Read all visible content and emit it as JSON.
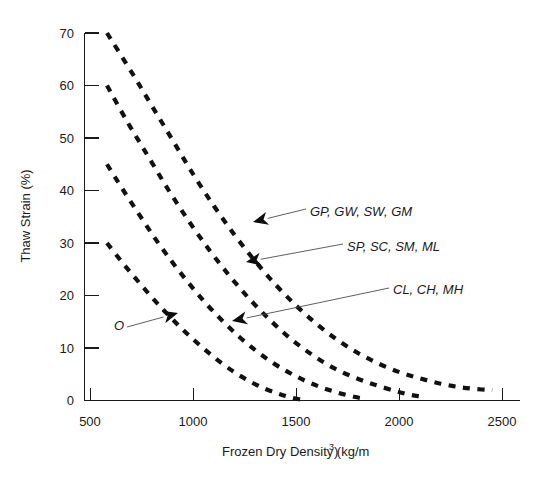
{
  "chart_data": {
    "type": "line",
    "title": "",
    "subtitle": "",
    "xlabel": "Frozen Dry Density (kg/m",
    "xlabel_sup": "3",
    "xlabel_tail": ")",
    "xlabel_full": "Frozen Dry Density (kg/m3)",
    "ylabel": "Thaw Strain (%)",
    "xlim": [
      450,
      2600
    ],
    "ylim": [
      0,
      70
    ],
    "xticks": [
      500,
      1000,
      1500,
      2000,
      2500
    ],
    "xtick_labels": [
      "500",
      "1000",
      "1500",
      "2000",
      "2500"
    ],
    "yticks": [
      0,
      10,
      20,
      30,
      40,
      50,
      60,
      70
    ],
    "ytick_labels": [
      "0",
      "10",
      "20",
      "30",
      "40",
      "50",
      "60",
      "70"
    ],
    "grid": false,
    "legend_position": "inline-annotations",
    "line_style": "dashed",
    "line_color": "#111111",
    "series": [
      {
        "name": "GP, GW, SW, GM",
        "label": "GP, GW, SW, GM",
        "x": [
          580,
          700,
          800,
          900,
          1000,
          1100,
          1200,
          1300,
          1400,
          1500,
          1600,
          1700,
          1800,
          1900,
          2000,
          2100,
          2200,
          2300,
          2400,
          2450
        ],
        "y": [
          70.0,
          62.5,
          56.0,
          49.5,
          43.0,
          37.0,
          31.5,
          26.5,
          22.0,
          18.0,
          14.5,
          11.5,
          9.0,
          7.0,
          5.4,
          4.2,
          3.2,
          2.5,
          2.1,
          2.0
        ]
      },
      {
        "name": "SP, SC, SM, ML",
        "label": "SP, SC, SM, ML",
        "x": [
          580,
          680,
          780,
          880,
          980,
          1080,
          1180,
          1280,
          1380,
          1480,
          1580,
          1680,
          1780,
          1880,
          1980,
          2050,
          2100
        ],
        "y": [
          60.0,
          53.0,
          46.5,
          40.0,
          34.0,
          28.5,
          23.5,
          19.0,
          15.0,
          11.5,
          8.6,
          6.2,
          4.4,
          3.0,
          1.8,
          1.1,
          0.8
        ]
      },
      {
        "name": "CL, CH, MH",
        "label": "CL, CH, MH",
        "x": [
          580,
          660,
          740,
          820,
          900,
          980,
          1060,
          1140,
          1220,
          1300,
          1380,
          1460,
          1540,
          1620,
          1700,
          1780,
          1820
        ],
        "y": [
          45.0,
          40.0,
          35.2,
          30.5,
          26.2,
          22.2,
          18.5,
          15.2,
          12.2,
          9.6,
          7.3,
          5.4,
          3.8,
          2.5,
          1.5,
          0.7,
          0.4
        ]
      },
      {
        "name": "O",
        "label": "O",
        "x": [
          580,
          650,
          720,
          790,
          860,
          930,
          1000,
          1070,
          1140,
          1210,
          1280,
          1350,
          1420,
          1480,
          1520
        ],
        "y": [
          30.0,
          26.5,
          23.2,
          20.0,
          17.0,
          14.2,
          11.6,
          9.2,
          7.0,
          5.1,
          3.5,
          2.2,
          1.2,
          0.5,
          0.2
        ]
      }
    ],
    "annotations": [
      {
        "text": "GP, GW, SW, GM",
        "text_x": 310,
        "text_y": 216,
        "leader_from_x": 306,
        "leader_from_y": 209,
        "arrow_to_x": 253,
        "arrow_to_y": 222
      },
      {
        "text": "SP, SC, SM, ML",
        "text_x": 347,
        "text_y": 251,
        "leader_from_x": 343,
        "leader_from_y": 244,
        "arrow_to_x": 246,
        "arrow_to_y": 262
      },
      {
        "text": "CL, CH, MH",
        "text_x": 393,
        "text_y": 294,
        "leader_from_x": 389,
        "leader_from_y": 288,
        "arrow_to_x": 232,
        "arrow_to_y": 321
      },
      {
        "text": "O",
        "text_x": 114,
        "text_y": 330,
        "leader_from_x": 127,
        "leader_from_y": 327,
        "arrow_to_x": 178,
        "arrow_to_y": 313
      }
    ]
  },
  "figure": {
    "background_color": "#ffffff",
    "axis_color": "#1a1a1a"
  }
}
